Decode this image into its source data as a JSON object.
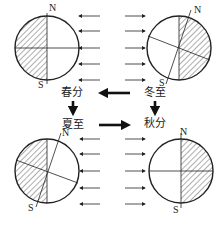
{
  "diagram": {
    "type": "earth-revolution-seasons",
    "colors": {
      "line": "#222222",
      "background": "#ffffff",
      "hatch": "#333333"
    },
    "seasons": [
      {
        "id": "spring_equinox",
        "label": "春分",
        "position": "top-left",
        "sunlight_direction": "from-right",
        "north_label": "N",
        "south_label": "S"
      },
      {
        "id": "winter_solstice",
        "label": "冬至",
        "position": "top-right",
        "sunlight_direction": "from-left",
        "north_label": "N",
        "south_label": "S"
      },
      {
        "id": "summer_solstice",
        "label": "夏至",
        "position": "bottom-left",
        "sunlight_direction": "from-right",
        "north_label": "N",
        "south_label": "S"
      },
      {
        "id": "autumn_equinox",
        "label": "秋分",
        "position": "bottom-right",
        "sunlight_direction": "from-left",
        "north_label": "N",
        "south_label": "S"
      }
    ],
    "flow": [
      "冬至 → 春分",
      "春分 → 夏至",
      "夏至 → 秋分",
      "冬至 → 秋分"
    ]
  }
}
